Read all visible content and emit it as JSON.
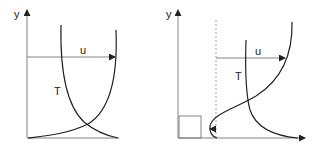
{
  "figure": {
    "panels": [
      {
        "id": "left",
        "axis_label_y": "y",
        "velocity_label": "u",
        "temperature_label": "T"
      },
      {
        "id": "right",
        "axis_label_y": "y",
        "velocity_label": "u",
        "temperature_label": "T"
      }
    ]
  },
  "colors": {
    "line": "#222222",
    "axis": "#555555",
    "dashed": "#777777",
    "background": "#ffffff"
  }
}
